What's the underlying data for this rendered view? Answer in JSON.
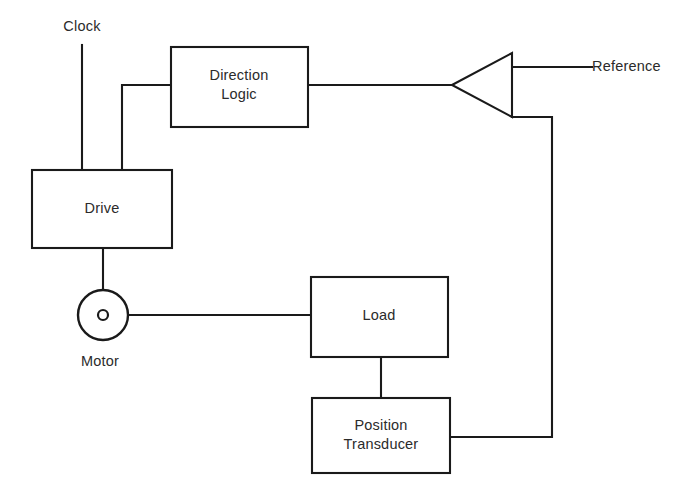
{
  "diagram": {
    "background_color": "#ffffff",
    "line_color": "#1a1a1a",
    "text_color": "#2b2b2b",
    "blocks": [
      {
        "id": "direction-logic",
        "label_line1": "Direction",
        "label_line2": "Logic",
        "x": 171,
        "y": 47,
        "width": 137,
        "height": 80
      },
      {
        "id": "drive",
        "label_line1": "Drive",
        "label_line2": "",
        "x": 32,
        "y": 170,
        "width": 140,
        "height": 78
      },
      {
        "id": "load",
        "label_line1": "Load",
        "label_line2": "",
        "x": 311,
        "y": 277,
        "width": 137,
        "height": 80
      },
      {
        "id": "position-transducer",
        "label_line1": "Position",
        "label_line2": "Transducer",
        "x": 312,
        "y": 398,
        "width": 138,
        "height": 75
      }
    ],
    "comparator": {
      "id": "summing-comparator",
      "shape": "triangle",
      "orientation": "points-left",
      "apex_x": 452,
      "apex_y": 85,
      "edge_x": 512,
      "top_y": 53,
      "bottom_y": 117
    },
    "motor": {
      "id": "motor",
      "label": "Motor",
      "center_x": 103,
      "center_y": 315,
      "radius": 25,
      "shaft_dot_radius": 5,
      "label_x": 100,
      "label_y": 352
    },
    "signals": [
      {
        "id": "clock-input",
        "label": "Clock",
        "label_x": 82,
        "label_y": 17,
        "from": "external",
        "to": "drive"
      },
      {
        "id": "reference-input",
        "label": "Reference",
        "label_x": 592,
        "label_y": 57,
        "from": "external",
        "to": "summing-comparator"
      }
    ],
    "connections": [
      {
        "id": "clock-to-drive",
        "path": "M82,45 L82,170"
      },
      {
        "id": "comparator-out-to-direction-logic",
        "path": "M122,170 L122,85 L171,85"
      },
      {
        "id": "direction-logic-to-comparator",
        "path": "M308,85 L452,85"
      },
      {
        "id": "reference-to-comparator",
        "path": "M512,67 L592,67"
      },
      {
        "id": "drive-to-motor",
        "path": "M103,248 L103,290"
      },
      {
        "id": "motor-to-load",
        "path": "M128,315 L311,315"
      },
      {
        "id": "load-to-transducer",
        "path": "M381,357 L381,398"
      },
      {
        "id": "transducer-feedback-to-comparator",
        "path": "M450,437 L552,437 L552,117 L512,117"
      }
    ]
  }
}
